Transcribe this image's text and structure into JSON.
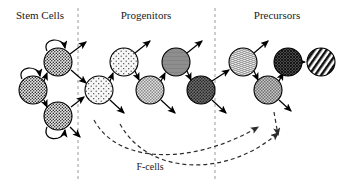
{
  "figure": {
    "background_color": "#ffffff",
    "width": 339,
    "height": 189
  },
  "stages": [
    {
      "id": "stem-cells",
      "label": "Stem Cells",
      "x": 40,
      "y": 15
    },
    {
      "id": "progenitors",
      "label": "Progenitors",
      "x": 146,
      "y": 15
    },
    {
      "id": "precursors",
      "label": "Precursors",
      "x": 277,
      "y": 15
    }
  ],
  "dividers": [
    {
      "id": "divider-1",
      "x": 78,
      "y1": 8,
      "y2": 182
    },
    {
      "id": "divider-2",
      "x": 215,
      "y1": 8,
      "y2": 182
    }
  ],
  "cells": [
    {
      "id": "stem-1",
      "texture": "dense-stipple",
      "cx": 33,
      "cy": 90,
      "r": 14,
      "fill": "#e8e8e8",
      "stage": "stem-cells"
    },
    {
      "id": "stem-2",
      "texture": "dense-stipple",
      "cx": 58,
      "cy": 62,
      "r": 14,
      "fill": "#e8e8e8",
      "stage": "stem-cells"
    },
    {
      "id": "stem-3",
      "texture": "dense-stipple",
      "cx": 58,
      "cy": 116,
      "r": 14,
      "fill": "#e8e8e8",
      "stage": "stem-cells"
    },
    {
      "id": "prog-1",
      "texture": "sparse-dots",
      "cx": 99,
      "cy": 90,
      "r": 14,
      "fill": "#f6f6f6",
      "stage": "progenitors"
    },
    {
      "id": "prog-2",
      "texture": "sparse-dots",
      "cx": 124,
      "cy": 62,
      "r": 14,
      "fill": "#f0f0f0",
      "stage": "progenitors"
    },
    {
      "id": "prog-3",
      "texture": "fine-check",
      "cx": 150,
      "cy": 90,
      "r": 14,
      "fill": "#d8d8d8",
      "stage": "progenitors"
    },
    {
      "id": "prog-4",
      "texture": "solid-gray",
      "cx": 176,
      "cy": 62,
      "r": 14,
      "fill": "#8e8e8e",
      "stage": "progenitors"
    },
    {
      "id": "prog-5",
      "texture": "dark-stipple",
      "cx": 201,
      "cy": 90,
      "r": 14,
      "fill": "#6e6e6e",
      "stage": "progenitors"
    },
    {
      "id": "prec-1",
      "texture": "wavy-bands",
      "cx": 243,
      "cy": 62,
      "r": 14,
      "fill": "#ededed",
      "stage": "precursors"
    },
    {
      "id": "prec-2",
      "texture": "mid-check",
      "cx": 268,
      "cy": 90,
      "r": 14,
      "fill": "#bdbdbd",
      "stage": "precursors"
    },
    {
      "id": "prec-3",
      "texture": "dark-crosshatch",
      "cx": 288,
      "cy": 62,
      "r": 14,
      "fill": "#555555",
      "stage": "precursors"
    },
    {
      "id": "prec-4",
      "texture": "diagonal-stripes",
      "cx": 321,
      "cy": 62,
      "r": 14,
      "fill": "#ffffff",
      "stage": "precursors"
    }
  ],
  "self_renewal_loops": [
    {
      "id": "loop-stem-1",
      "cell": "stem-1"
    },
    {
      "id": "loop-stem-2",
      "cell": "stem-2"
    },
    {
      "id": "loop-stem-3",
      "cell": "stem-3"
    }
  ],
  "feedback": {
    "label": "F-cells",
    "label_x": 150,
    "label_y": 170,
    "curves": 2,
    "style": "dashed"
  }
}
